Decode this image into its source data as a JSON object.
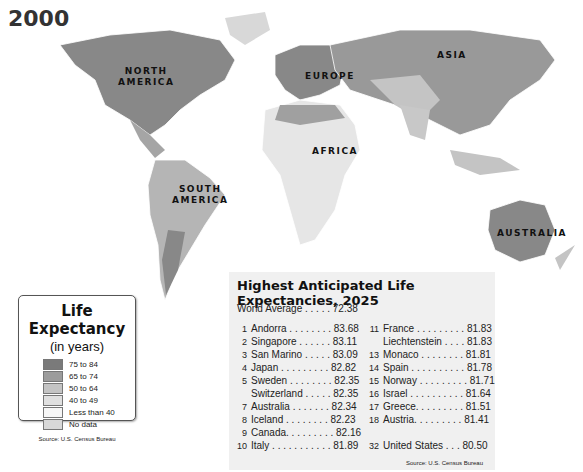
{
  "map": {
    "year": "2000",
    "continents": [
      {
        "name": "NORTH AMERICA",
        "line1": "NORTH",
        "line2": "AMERICA"
      },
      {
        "name": "EUROPE",
        "line1": "EUROPE"
      },
      {
        "name": "ASIA",
        "line1": "ASIA"
      },
      {
        "name": "AFRICA",
        "line1": "AFRICA"
      },
      {
        "name": "SOUTH AMERICA",
        "line1": "SOUTH",
        "line2": "AMERICA"
      },
      {
        "name": "AUSTRALIA",
        "line1": "AUSTRALIA"
      }
    ]
  },
  "legend": {
    "title": "Life Expectancy",
    "subtitle": "(in years)",
    "items": [
      {
        "label": "75 to 84",
        "color": "#7a7a7a"
      },
      {
        "label": "65 to 74",
        "color": "#9c9c9c"
      },
      {
        "label": "50 to 64",
        "color": "#c4c4c4"
      },
      {
        "label": "40 to 49",
        "color": "#e0e0e0"
      },
      {
        "label": "Less than 40",
        "color": "#f6f6f6"
      },
      {
        "label": "No data",
        "color": "#d8d8d8"
      }
    ],
    "source": "Source: U.S. Census Bureau"
  },
  "table": {
    "title": "Highest Anticipated Life Expectancies, 2025",
    "world_average": "World Average . . . . . 72.38",
    "left": [
      {
        "rank": "1",
        "text": "Andorra . . . . . . . . 83.68"
      },
      {
        "rank": "2",
        "text": "Singapore . . . . . . 83.11"
      },
      {
        "rank": "3",
        "text": "San Marino . . . . . 83.09"
      },
      {
        "rank": "4",
        "text": "Japan . . . . . . . . . 82.82"
      },
      {
        "rank": "5",
        "text": "Sweden . . . . . . . . 82.35"
      },
      {
        "rank": "",
        "text": "Switzerland . . . . . 82.35"
      },
      {
        "rank": "7",
        "text": "Australia . . . . . . . 82.34"
      },
      {
        "rank": "8",
        "text": "Iceland . . . . . . . . 82.23"
      },
      {
        "rank": "9",
        "text": "Canada. . . . . . . . . 82.16"
      },
      {
        "rank": "10",
        "text": "Italy . . . . . . . . . . . 81.89"
      }
    ],
    "right": [
      {
        "rank": "11",
        "text": "France . . . . . . . . . 81.83"
      },
      {
        "rank": "",
        "text": "Liechtenstein . . . . 81.83"
      },
      {
        "rank": "13",
        "text": "Monaco . . . . . . . . 81.81"
      },
      {
        "rank": "14",
        "text": "Spain . . . . . . . . . . 81.78"
      },
      {
        "rank": "15",
        "text": "Norway . . . . . . . . . 81.71"
      },
      {
        "rank": "16",
        "text": "Israel . . . . . . . . . . 81.64"
      },
      {
        "rank": "17",
        "text": "Greece. . . . . . . . . 81.51"
      },
      {
        "rank": "18",
        "text": "Austria. . . . . . . . . 81.41"
      },
      {
        "rank": "",
        "text": ""
      },
      {
        "rank": "32",
        "text": "United States . . . 80.50"
      }
    ],
    "source": "Source: U.S. Census Bureau"
  }
}
